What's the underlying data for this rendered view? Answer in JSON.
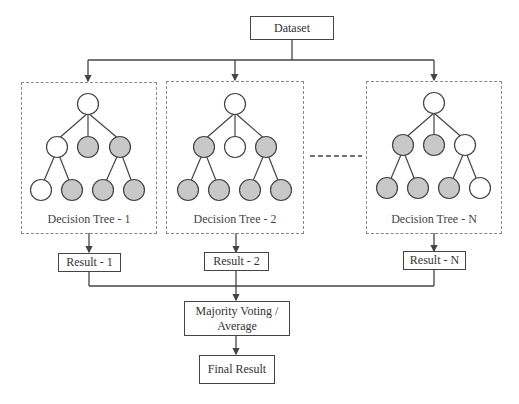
{
  "diagram": {
    "dataset_label": "Dataset",
    "trees": [
      {
        "label": "Decision Tree - 1",
        "nodes": {
          "root": "white",
          "level1": [
            "white",
            "gray",
            "gray"
          ],
          "level2": [
            "white",
            "gray",
            "gray",
            "gray"
          ]
        }
      },
      {
        "label": "Decision Tree - 2",
        "nodes": {
          "root": "white",
          "level1": [
            "gray",
            "white",
            "gray"
          ],
          "level2": [
            "gray",
            "gray",
            "gray",
            "gray"
          ]
        }
      },
      {
        "label": "Decision Tree - N",
        "nodes": {
          "root": "white",
          "level1": [
            "gray",
            "gray",
            "white"
          ],
          "level2": [
            "gray",
            "gray",
            "gray",
            "white"
          ]
        }
      }
    ],
    "results": [
      "Result - 1",
      "Result - 2",
      "Result - N"
    ],
    "aggregator_label": "Majority Voting / Average",
    "final_label": "Final Result",
    "colors": {
      "node_fill_gray": "#c8c8c8",
      "node_fill_white": "#ffffff",
      "stroke": "#444444"
    }
  }
}
